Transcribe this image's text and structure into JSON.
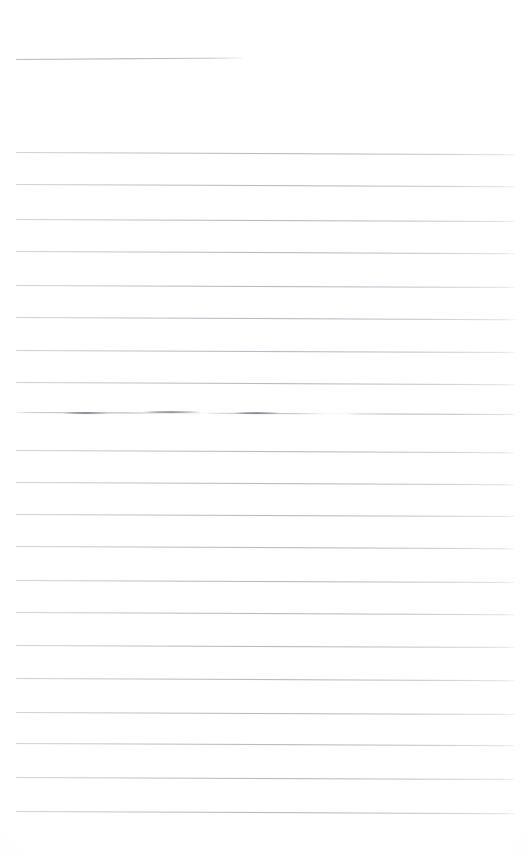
{
  "document": {
    "title": "Scanned Ruled Page",
    "kind": "blank-lined-page",
    "page_width": 530,
    "page_height": 858,
    "background_color": "#fefefe",
    "line_color": "#b2b4bc",
    "ink_color": "#6a6c76",
    "description": "A faded scan of a blank ruled sheet. A short header rule near the top, then a column of evenly spaced horizontal ruled lines, one of which carries broken darker ink strokes."
  },
  "header_rule": {
    "name": "header-rule",
    "x": 16,
    "y": 59,
    "width": 226,
    "slope_deg": -0.35,
    "style": "header"
  },
  "ruled_lines": [
    {
      "name": "ruled-line-1",
      "x": 16,
      "y": 152,
      "width": 499,
      "slope_deg": 0.25,
      "style": "faint"
    },
    {
      "name": "ruled-line-2",
      "x": 16,
      "y": 184,
      "width": 499,
      "slope_deg": 0.25,
      "style": "faint"
    },
    {
      "name": "ruled-line-3",
      "x": 16,
      "y": 219,
      "width": 499,
      "slope_deg": 0.22,
      "style": "faint"
    },
    {
      "name": "ruled-line-4",
      "x": 16,
      "y": 251,
      "width": 499,
      "slope_deg": 0.25,
      "style": "faint"
    },
    {
      "name": "ruled-line-5",
      "x": 16,
      "y": 285,
      "width": 499,
      "slope_deg": 0.22,
      "style": "faint"
    },
    {
      "name": "ruled-line-6",
      "x": 16,
      "y": 317,
      "width": 499,
      "slope_deg": 0.25,
      "style": "faint"
    },
    {
      "name": "ruled-line-7",
      "x": 16,
      "y": 350,
      "width": 499,
      "slope_deg": 0.22,
      "style": "faint"
    },
    {
      "name": "ruled-line-8",
      "x": 16,
      "y": 382,
      "width": 499,
      "slope_deg": 0.25,
      "style": "faint"
    },
    {
      "name": "ruled-line-9-inked",
      "x": 16,
      "y": 412,
      "width": 499,
      "slope_deg": 0.22,
      "style": "inked"
    },
    {
      "name": "ruled-line-10",
      "x": 16,
      "y": 450,
      "width": 499,
      "slope_deg": 0.25,
      "style": "faint"
    },
    {
      "name": "ruled-line-11",
      "x": 16,
      "y": 482,
      "width": 499,
      "slope_deg": 0.25,
      "style": "faint"
    },
    {
      "name": "ruled-line-12",
      "x": 16,
      "y": 514,
      "width": 499,
      "slope_deg": 0.22,
      "style": "faint"
    },
    {
      "name": "ruled-line-13",
      "x": 16,
      "y": 546,
      "width": 499,
      "slope_deg": 0.25,
      "style": "faint"
    },
    {
      "name": "ruled-line-14",
      "x": 16,
      "y": 580,
      "width": 499,
      "slope_deg": 0.22,
      "style": "faint"
    },
    {
      "name": "ruled-line-15",
      "x": 16,
      "y": 612,
      "width": 499,
      "slope_deg": 0.25,
      "style": "faint"
    },
    {
      "name": "ruled-line-16",
      "x": 16,
      "y": 645,
      "width": 499,
      "slope_deg": 0.22,
      "style": "faint"
    },
    {
      "name": "ruled-line-17",
      "x": 16,
      "y": 678,
      "width": 499,
      "slope_deg": 0.25,
      "style": "faint"
    },
    {
      "name": "ruled-line-18",
      "x": 16,
      "y": 712,
      "width": 499,
      "slope_deg": 0.22,
      "style": "faint"
    },
    {
      "name": "ruled-line-19",
      "x": 16,
      "y": 743,
      "width": 499,
      "slope_deg": 0.25,
      "style": "faint"
    },
    {
      "name": "ruled-line-20",
      "x": 16,
      "y": 777,
      "width": 499,
      "slope_deg": 0.22,
      "style": "faint"
    },
    {
      "name": "ruled-line-21",
      "x": 16,
      "y": 811,
      "width": 499,
      "slope_deg": 0.25,
      "style": "faint"
    }
  ],
  "ink_marks": [
    {
      "name": "ink-stroke-1",
      "x": 63,
      "y": 412,
      "width": 46,
      "slope_deg": 0.2
    },
    {
      "name": "ink-stroke-2",
      "x": 143,
      "y": 411,
      "width": 58,
      "slope_deg": 0.2
    },
    {
      "name": "ink-stroke-3",
      "x": 234,
      "y": 412,
      "width": 46,
      "slope_deg": 0.2
    }
  ]
}
